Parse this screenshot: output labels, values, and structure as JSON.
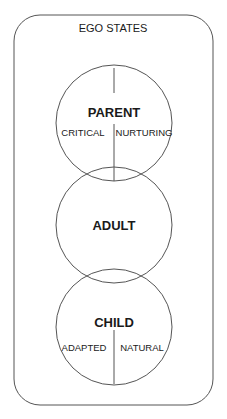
{
  "diagram": {
    "title": "EGO STATES",
    "line_color": "#555555",
    "states": [
      {
        "name": "PARENT",
        "subdivisions": [
          "CRITICAL",
          "NURTURING"
        ]
      },
      {
        "name": "ADULT",
        "subdivisions": []
      },
      {
        "name": "CHILD",
        "subdivisions": [
          "ADAPTED",
          "NATURAL"
        ]
      }
    ]
  }
}
